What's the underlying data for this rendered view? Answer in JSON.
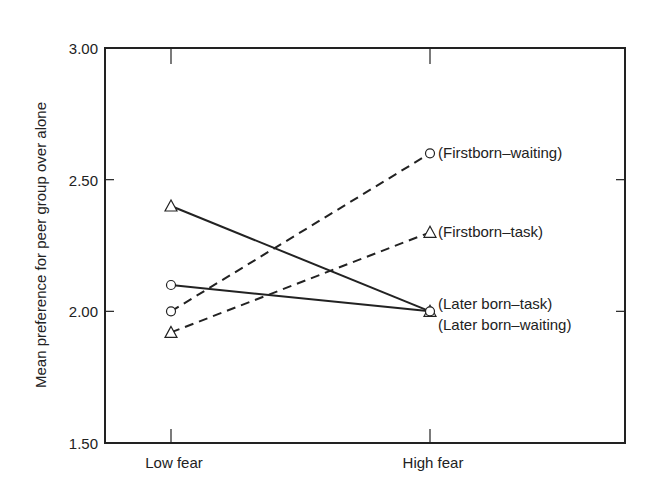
{
  "chart_data": {
    "type": "line",
    "title": "",
    "xlabel": "",
    "ylabel": "Mean preference for peer group over alone",
    "categories": [
      "Low fear",
      "High fear"
    ],
    "ylim": [
      1.5,
      3.0
    ],
    "yticks": [
      1.5,
      2.0,
      2.5,
      3.0
    ],
    "ytick_labels": [
      "1.50",
      "2.00",
      "2.50",
      "3.00"
    ],
    "grid": false,
    "legend": "direct labels at right end of lines",
    "series": [
      {
        "name": "(Firstborn–waiting)",
        "values": [
          2.0,
          2.6
        ],
        "marker": "circle",
        "line": "dashed"
      },
      {
        "name": "(Firstborn–task)",
        "values": [
          1.92,
          2.3
        ],
        "marker": "triangle",
        "line": "dashed"
      },
      {
        "name": "(Later born–task)",
        "values": [
          2.4,
          2.0
        ],
        "marker": "triangle",
        "line": "solid"
      },
      {
        "name": "(Later born–waiting)",
        "values": [
          2.1,
          2.0
        ],
        "marker": "circle",
        "line": "solid"
      }
    ],
    "colors": {
      "ink": "#222222",
      "background": "#ffffff"
    }
  }
}
